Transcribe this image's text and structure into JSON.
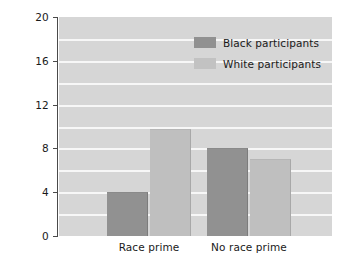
{
  "chart_data": {
    "type": "bar",
    "title": "",
    "subtitle": "",
    "xlabel": "",
    "ylabel": "Mean items solved",
    "categories": [
      "Race prime",
      "No race prime"
    ],
    "series": [
      {
        "name": "Black participants",
        "color": "#919191",
        "values": [
          4,
          8
        ]
      },
      {
        "name": "White participants",
        "color": "#bfbfbf",
        "values": [
          9.8,
          7
        ]
      }
    ],
    "ylim": [
      0,
      20
    ],
    "yticks": [
      0,
      4,
      8,
      12,
      16,
      20
    ],
    "ytick_labels": [
      "0",
      "4",
      "8",
      "12",
      "16",
      "20"
    ],
    "gridlines": {
      "axis": "y",
      "visible": true,
      "color": "#f7f7f7",
      "values": [
        2,
        4,
        6,
        8,
        10,
        12,
        14,
        16,
        18
      ]
    },
    "legend": {
      "position": "upper right inside",
      "entries": [
        {
          "label": "Black participants",
          "color": "#919191"
        },
        {
          "label": "White participants",
          "color": "#c2c2c2"
        }
      ]
    },
    "plot_background": "#d6d6d6",
    "figure_background": "#ffffff"
  }
}
